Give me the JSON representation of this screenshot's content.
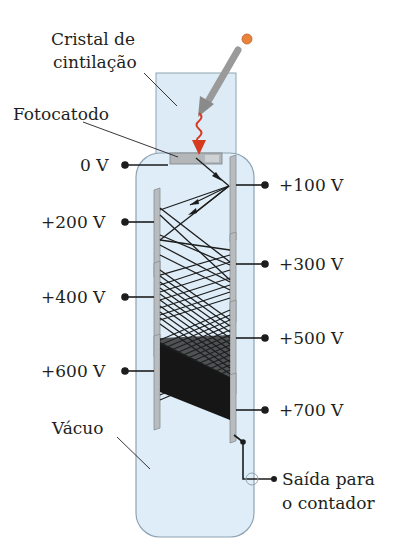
{
  "diagram": {
    "colors": {
      "tube_fill": "#deedf7",
      "tube_stroke": "#8fa3b2",
      "crystal_fill": "#dcebf6",
      "dynode_fill": "#b9bcbf",
      "dynode_stroke": "#8a8d90",
      "particle": "#e8843a",
      "photon": "#d63a1f",
      "incoming_arrow": "#8c8c8c",
      "electron_path": "#1d1d1d",
      "text": "#231f20"
    },
    "labels": {
      "crystal_line1": "Cristal de",
      "crystal_line2": "cintilação",
      "photocathode": "Fotocatodo",
      "vacuum": "Vácuo",
      "output_line1": "Saída para",
      "output_line2": "o contador"
    },
    "voltages": {
      "v0": "0 V",
      "v100": "+100 V",
      "v200": "+200 V",
      "v300": "+300 V",
      "v400": "+400 V",
      "v500": "+500 V",
      "v600": "+600 V",
      "v700": "+700 V"
    },
    "dynodes": [
      {
        "voltage": "+100 V",
        "side": "right"
      },
      {
        "voltage": "+200 V",
        "side": "left"
      },
      {
        "voltage": "+300 V",
        "side": "right"
      },
      {
        "voltage": "+400 V",
        "side": "left"
      },
      {
        "voltage": "+500 V",
        "side": "right"
      },
      {
        "voltage": "+600 V",
        "side": "left"
      },
      {
        "voltage": "+700 V",
        "side": "right"
      }
    ]
  }
}
